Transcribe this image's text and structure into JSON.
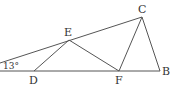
{
  "diagram": {
    "type": "geometry",
    "points": {
      "C": {
        "label": "C",
        "x": 142,
        "y": 17
      },
      "E": {
        "label": "E",
        "x": 69,
        "y": 40
      },
      "D": {
        "label": "D",
        "x": 34,
        "y": 71
      },
      "F": {
        "label": "F",
        "x": 119,
        "y": 71
      },
      "B": {
        "label": "B",
        "x": 160,
        "y": 71
      }
    },
    "angle_label": "13°",
    "segments": [
      "AC",
      "AB",
      "DE",
      "EF",
      "FC",
      "CB"
    ],
    "line_color": "#555555"
  }
}
